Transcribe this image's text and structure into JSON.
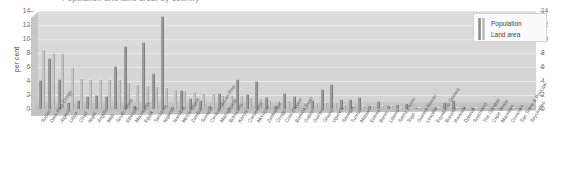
{
  "chart": {
    "title": "Population and land area, by country",
    "ylabel": "per cent"
  },
  "legend": {
    "position": "top-right",
    "entries": [
      {
        "label": "Population",
        "color": "#8e8e8e"
      },
      {
        "label": "Land area",
        "color": "#b9b9b9"
      }
    ]
  },
  "axis": {
    "left_ticks": [
      "14",
      "12",
      "10",
      "8",
      "6",
      "4",
      "2",
      "0"
    ],
    "right_ticks": [
      "14",
      "12",
      "10",
      "8",
      "6",
      "4",
      "2",
      "0"
    ]
  },
  "chart_data": {
    "type": "bar",
    "title": "Population and land area, by country",
    "xlabel": "",
    "ylabel": "per cent",
    "ylim": [
      0,
      14
    ],
    "grid": true,
    "legend_position": "top-right",
    "categories": [
      "Sudan",
      "Dem Rep Congo",
      "Algeria",
      "Libya",
      "Chad",
      "Niger",
      "Angola",
      "Mali",
      "South Africa",
      "Ethiopia",
      "Mauritania",
      "Egypt",
      "Tanzania",
      "Nigeria",
      "Namibia",
      "Mozambique",
      "Zambia",
      "Somalia",
      "Central African Rep",
      "Madagascar",
      "Botswana",
      "Kenya",
      "Cameroon",
      "Morocco",
      "Zimbabwe",
      "Congo",
      "Cote d'Ivoire",
      "Burkina Faso",
      "Gabon",
      "Guinea",
      "Ghana",
      "Uganda",
      "Senegal",
      "Tunisia",
      "Malawi",
      "Eritrea",
      "Benin",
      "Liberia",
      "Sierra Leone",
      "Togo",
      "Guinea Bissau",
      "Lesotho",
      "Equatorial Guinea",
      "Burundi",
      "Rwanda",
      "Djibouti",
      "Swaziland",
      "The Gambia",
      "Cape Verde",
      "Mauritius",
      "Comoros",
      "Sao Tome & Principe",
      "Seychelles"
    ],
    "series": [
      {
        "name": "Population",
        "values": [
          4.0,
          7.2,
          4.2,
          0.8,
          1.2,
          1.7,
          1.9,
          1.7,
          6.0,
          8.9,
          0.4,
          9.4,
          5.0,
          13.1,
          0.3,
          2.6,
          1.4,
          1.2,
          0.5,
          2.2,
          0.2,
          4.2,
          2.0,
          3.8,
          1.6,
          0.5,
          2.2,
          1.7,
          0.2,
          1.1,
          2.7,
          3.4,
          1.3,
          1.3,
          1.6,
          0.5,
          1.0,
          0.4,
          0.6,
          0.7,
          0.2,
          0.2,
          0.1,
          0.9,
          1.1,
          0.1,
          0.1,
          0.2,
          0.1,
          0.2,
          0.1,
          0.0,
          0.0
        ]
      },
      {
        "name": "Land area",
        "values": [
          8.4,
          7.8,
          7.9,
          5.9,
          4.3,
          4.2,
          4.1,
          4.1,
          4.1,
          3.7,
          3.4,
          3.3,
          3.1,
          3.0,
          2.7,
          2.6,
          2.5,
          2.1,
          2.1,
          1.9,
          1.9,
          1.9,
          1.6,
          1.5,
          1.3,
          1.1,
          1.1,
          0.9,
          0.9,
          0.8,
          0.8,
          0.8,
          0.6,
          0.5,
          0.4,
          0.4,
          0.4,
          0.4,
          0.2,
          0.2,
          0.1,
          0.1,
          0.1,
          0.1,
          0.1,
          0.1,
          0.1,
          0.0,
          0.0,
          0.0,
          0.0,
          0.0,
          0.0
        ]
      }
    ]
  }
}
